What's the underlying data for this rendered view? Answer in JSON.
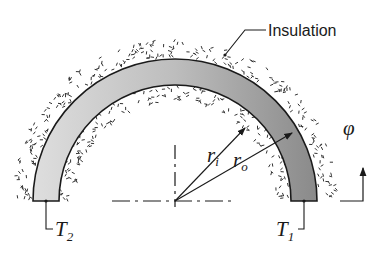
{
  "figure": {
    "labels": {
      "insulation": "Insulation",
      "r_inner_main": "r",
      "r_inner_sub": "i",
      "r_outer_main": "r",
      "r_outer_sub": "o",
      "phi": "φ",
      "t2_main": "T",
      "t2_sub": "2",
      "t1_main": "T",
      "t1_sub": "1"
    },
    "colors": {
      "ring_light": "#dcdcdc",
      "ring_dark": "#8e8e8e",
      "stroke": "#1a1a1a",
      "background": "#ffffff"
    }
  }
}
